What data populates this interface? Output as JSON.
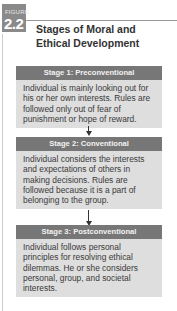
{
  "figure": {
    "label": "FIGURE",
    "number": "2.2",
    "title": "Stages of Moral and Ethical Development"
  },
  "stages": [
    {
      "heading": "Stage 1: Preconventional",
      "description": "Individual is mainly looking out for his or her own interests. Rules are followed only out of fear of punishment or hope of reward."
    },
    {
      "heading": "Stage 2: Conventional",
      "description": "Individual considers the interests and expectations of others in making decisions. Rules are followed because it is a part of belonging to the group."
    },
    {
      "heading": "Stage 3: Postconventional",
      "description": "Individual follows personal principles for resolving ethical dilemmas. He or she considers personal, group, and societal interests."
    }
  ],
  "colors": {
    "stage_header": "#777777",
    "stage_body": "#dedede",
    "badge": "#8a8a8a"
  }
}
